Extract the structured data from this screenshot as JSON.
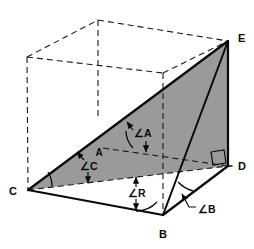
{
  "figure": {
    "colors": {
      "stroke": "#0a0a0a",
      "shaded_face": "#9a9a9a",
      "background": "#ffffff",
      "hidden_line": "#1a1a1a"
    },
    "vertex_labels": [
      {
        "id": "E",
        "text": "E",
        "x": 238,
        "y": 42
      },
      {
        "id": "C",
        "text": "C",
        "x": 13,
        "y": 195
      },
      {
        "id": "D",
        "text": "D",
        "x": 238,
        "y": 170
      },
      {
        "id": "B",
        "text": "B",
        "x": 160,
        "y": 238
      }
    ],
    "point_labels": [
      {
        "id": "A",
        "text": "A",
        "x": 96,
        "y": 155
      }
    ],
    "angle_labels": [
      {
        "id": "angle-A",
        "text": "∠A",
        "x": 134,
        "y": 137
      },
      {
        "id": "angle-C",
        "text": "∠C",
        "x": 80,
        "y": 168
      },
      {
        "id": "angle-R",
        "text": "∠R",
        "x": 127,
        "y": 195
      },
      {
        "id": "angle-B",
        "text": "∠B",
        "x": 198,
        "y": 213
      }
    ],
    "markers": {
      "right_angle_at_D": "right-angle-square"
    },
    "geometry": {
      "points": {
        "C": [
          28,
          190
        ],
        "B": [
          163,
          215
        ],
        "D": [
          228,
          166
        ],
        "E": [
          228,
          41
        ],
        "A": [
          103,
          148
        ],
        "top_back_left": [
          27,
          57
        ],
        "top_back_mid": [
          98,
          20
        ],
        "top_front_right": [
          228,
          41
        ],
        "top_front_mid": [
          163,
          73
        ],
        "box_back_right": [
          228,
          41
        ]
      }
    }
  }
}
